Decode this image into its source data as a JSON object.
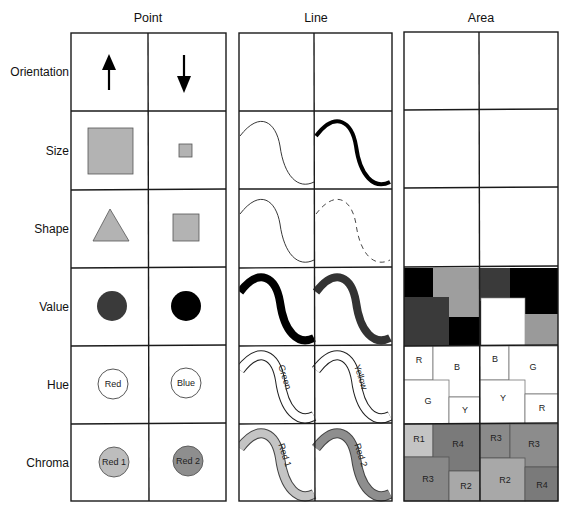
{
  "columns": [
    {
      "key": "point",
      "label": "Point"
    },
    {
      "key": "line",
      "label": "Line"
    },
    {
      "key": "area",
      "label": "Area"
    }
  ],
  "rows": [
    {
      "key": "orientation",
      "label": "Orientation"
    },
    {
      "key": "size",
      "label": "Size"
    },
    {
      "key": "shape",
      "label": "Shape"
    },
    {
      "key": "value",
      "label": "Value"
    },
    {
      "key": "hue",
      "label": "Hue"
    },
    {
      "key": "chroma",
      "label": "Chroma"
    }
  ],
  "point": {
    "orientation": [
      "arrow-up-icon",
      "arrow-down-icon"
    ],
    "size": [
      "large-square",
      "small-square"
    ],
    "shape": [
      "triangle",
      "square"
    ],
    "value": [
      "dark-gray-circle",
      "black-circle"
    ],
    "hue": [
      "Red",
      "Blue"
    ],
    "chroma": [
      "Red 1",
      "Red 2"
    ]
  },
  "line": {
    "size": [
      "thin-line",
      "thick-line"
    ],
    "shape": [
      "solid-line",
      "dashed-line"
    ],
    "value": [
      "black-line",
      "dark-gray-line"
    ],
    "hue": [
      "Green",
      "Yellow"
    ],
    "chroma": [
      "Red 1",
      "Red 2"
    ]
  },
  "area": {
    "hue": {
      "left": [
        "R",
        "B",
        "G",
        "Y"
      ],
      "right": [
        "B",
        "G",
        "Y",
        "R"
      ]
    },
    "chroma": {
      "left": [
        "R1",
        "R4",
        "R3",
        "R2"
      ],
      "right": [
        "R3",
        "R3",
        "R2",
        "R4"
      ]
    }
  },
  "colors": {
    "grid": "#1a1a1a",
    "light_gray": "#b3b3b3",
    "mid_gray": "#999999",
    "dark_gray": "#3a3a3a",
    "chroma_1": "#c4c4c4",
    "chroma_2": "#999999",
    "chroma_3": "#888888",
    "chroma_4": "#7a7a7a",
    "black": "#000000",
    "white": "#ffffff"
  }
}
